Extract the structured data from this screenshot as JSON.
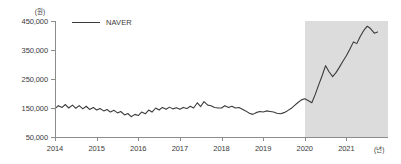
{
  "chart_data": {
    "type": "line",
    "title": "",
    "xlabel": "(년)",
    "ylabel": "(원)",
    "unit_y": "(원)",
    "unit_x": "(년)",
    "xlim": [
      2014.0,
      2022.0
    ],
    "ylim": [
      50000,
      450000
    ],
    "grid": false,
    "legend_position": "top-left",
    "y_ticks": [
      450000,
      350000,
      250000,
      150000,
      50000
    ],
    "y_tick_labels": [
      "450,000",
      "350,000",
      "250,000",
      "150,000",
      "50,000"
    ],
    "x_ticks": [
      2014,
      2015,
      2016,
      2017,
      2018,
      2019,
      2020,
      2021
    ],
    "x_tick_labels": [
      "2014",
      "2015",
      "2016",
      "2017",
      "2018",
      "2019",
      "2020",
      "2021"
    ],
    "shaded_region": {
      "label": "",
      "x_start": 2020.0,
      "x_end": 2022.0,
      "color": "#dcdcdc"
    },
    "series": [
      {
        "name": "NAVER",
        "color": "#3b3b3b",
        "x": [
          2014.0,
          2014.08,
          2014.17,
          2014.25,
          2014.33,
          2014.42,
          2014.5,
          2014.58,
          2014.67,
          2014.75,
          2014.83,
          2014.92,
          2015.0,
          2015.08,
          2015.17,
          2015.25,
          2015.33,
          2015.42,
          2015.5,
          2015.58,
          2015.67,
          2015.75,
          2015.83,
          2015.92,
          2016.0,
          2016.08,
          2016.17,
          2016.25,
          2016.33,
          2016.42,
          2016.5,
          2016.58,
          2016.67,
          2016.75,
          2016.83,
          2016.92,
          2017.0,
          2017.08,
          2017.17,
          2017.25,
          2017.33,
          2017.42,
          2017.5,
          2017.58,
          2017.67,
          2017.75,
          2017.83,
          2017.92,
          2018.0,
          2018.08,
          2018.17,
          2018.25,
          2018.33,
          2018.42,
          2018.5,
          2018.58,
          2018.67,
          2018.75,
          2018.83,
          2018.92,
          2019.0,
          2019.08,
          2019.17,
          2019.25,
          2019.33,
          2019.42,
          2019.5,
          2019.58,
          2019.67,
          2019.75,
          2019.83,
          2019.92,
          2020.0,
          2020.08,
          2020.17,
          2020.25,
          2020.33,
          2020.42,
          2020.5,
          2020.58,
          2020.67,
          2020.75,
          2020.83,
          2020.92,
          2021.0,
          2021.08,
          2021.17,
          2021.25,
          2021.33,
          2021.42,
          2021.5,
          2021.58,
          2021.67,
          2021.75
        ],
        "values": [
          148000,
          158000,
          152000,
          162000,
          150000,
          160000,
          149000,
          158000,
          147000,
          156000,
          145000,
          152000,
          143000,
          148000,
          140000,
          145000,
          136000,
          142000,
          133000,
          138000,
          126000,
          131000,
          120000,
          128000,
          124000,
          136000,
          130000,
          143000,
          136000,
          150000,
          143000,
          152000,
          146000,
          153000,
          147000,
          151000,
          146000,
          152000,
          148000,
          156000,
          150000,
          168000,
          155000,
          172000,
          160000,
          158000,
          152000,
          150000,
          150000,
          158000,
          152000,
          156000,
          150000,
          152000,
          146000,
          140000,
          132000,
          128000,
          134000,
          138000,
          136000,
          140000,
          138000,
          136000,
          132000,
          130000,
          134000,
          140000,
          148000,
          158000,
          168000,
          178000,
          182000,
          176000,
          168000,
          196000,
          228000,
          262000,
          296000,
          276000,
          258000,
          272000,
          290000,
          312000,
          330000,
          352000,
          378000,
          372000,
          396000,
          418000,
          432000,
          424000,
          408000,
          412000
        ]
      }
    ]
  },
  "legend": {
    "entries": [
      {
        "label": "NAVER",
        "color": "#3b3b3b"
      }
    ]
  }
}
